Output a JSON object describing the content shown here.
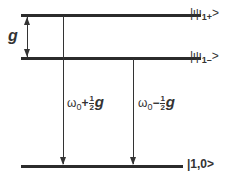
{
  "diagram": {
    "type": "energy-level-diagram",
    "levels": [
      {
        "id": "upper",
        "label": "|ψ1+>",
        "label_main": "|ψ",
        "label_sub": "1+",
        "label_end": ">"
      },
      {
        "id": "middle",
        "label": "|ψ1->",
        "label_main": "|ψ",
        "label_sub": "1–",
        "label_end": ">"
      },
      {
        "id": "ground",
        "label": "|1,0>"
      }
    ],
    "splitting": {
      "label": "g"
    },
    "transitions": [
      {
        "from": "upper",
        "to": "ground",
        "omega": "ω",
        "sub": "0",
        "sign": "+",
        "num": "1",
        "den": "2",
        "g": "g"
      },
      {
        "from": "middle",
        "to": "ground",
        "omega": "ω",
        "sub": "0",
        "sign": "−",
        "num": "1",
        "den": "2",
        "g": "g"
      }
    ]
  }
}
